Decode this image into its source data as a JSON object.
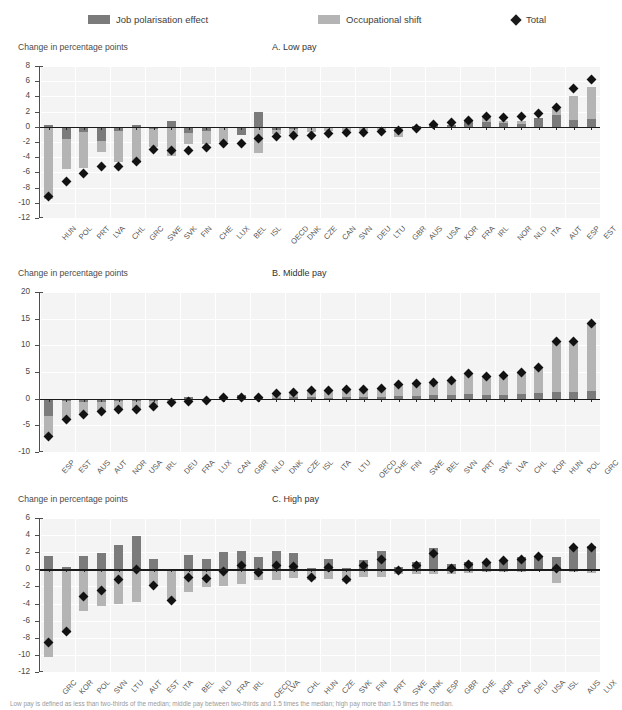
{
  "legend": {
    "items": [
      {
        "label": "Job polarisation effect",
        "marker": "square-dark",
        "color": "#7b7b7b",
        "x": 88
      },
      {
        "label": "Occupational shift",
        "marker": "square-light",
        "color": "#b4b4b4",
        "x": 318
      },
      {
        "label": "Total",
        "marker": "diamond",
        "color": "#1b1b1b",
        "x": 512
      }
    ]
  },
  "axis_title": "Change in percentage points",
  "footnote": "Low pay is defined as less than two-thirds of the median; middle pay between two-thirds and 1.5 times the median; high pay more than 1.5 times the median.",
  "chart_data": [
    {
      "type": "bar",
      "panel": "A",
      "title": "A. Low pay",
      "ylabel": "Change in percentage points",
      "xlabel": "",
      "ylim": [
        -12,
        8
      ],
      "yticks": [
        8,
        6,
        4,
        2,
        0,
        -2,
        -4,
        -6,
        -8,
        -10,
        -12
      ],
      "grid": true,
      "legend_position": "top",
      "categories": [
        "HUN",
        "POL",
        "PRT",
        "LVA",
        "CHL",
        "GRC",
        "SWE",
        "SVK",
        "FIN",
        "CHE",
        "LUX",
        "BEL",
        "ISL",
        "OECD",
        "DNK",
        "CZE",
        "CAN",
        "SVN",
        "DEU",
        "LTU",
        "GBR",
        "AUS",
        "USA",
        "KOR",
        "FRA",
        "IRL",
        "NOR",
        "NLD",
        "ITA",
        "AUT",
        "ESP",
        "EST"
      ],
      "series": [
        {
          "name": "Job polarisation effect",
          "values": [
            0.3,
            -1.6,
            -0.7,
            -1.9,
            -0.6,
            0.3,
            -0.3,
            0.8,
            -0.8,
            -0.5,
            -0.2,
            -1.1,
            1.9,
            -0.4,
            -0.3,
            -0.2,
            -0.1,
            -0.1,
            -0.1,
            -0.1,
            -0.1,
            0.1,
            0.4,
            0.3,
            0.8,
            0.6,
            0.5,
            0.4,
            1.1,
            1.6,
            0.9,
            1.0
          ]
        },
        {
          "name": "Occupational shift",
          "values": [
            -9.5,
            -5.6,
            -5.4,
            -3.3,
            -4.6,
            -4.8,
            -2.7,
            -3.9,
            -2.3,
            -2.2,
            -2.0,
            -1.1,
            -3.4,
            -0.9,
            -0.9,
            -0.7,
            -0.6,
            -0.6,
            -0.6,
            -0.4,
            -1.3,
            -0.2,
            -0.2,
            0.1,
            0.3,
            1.3,
            0.7,
            0.8,
            0.8,
            2.3,
            4.0,
            5.2
          ]
        }
      ],
      "total": {
        "name": "Total",
        "values": [
          -9.2,
          -7.2,
          -6.1,
          -5.2,
          -5.2,
          -4.5,
          -3.0,
          -3.1,
          -3.1,
          -2.7,
          -2.2,
          -2.2,
          -1.5,
          -1.3,
          -1.2,
          -1.1,
          -0.9,
          -0.7,
          -0.7,
          -0.6,
          -0.5,
          -0.2,
          0.3,
          0.6,
          0.8,
          1.4,
          1.2,
          1.3,
          1.8,
          2.6,
          5.0,
          6.2
        ]
      }
    },
    {
      "type": "bar",
      "panel": "B",
      "title": "B. Middle pay",
      "ylabel": "Change in percentage points",
      "xlabel": "",
      "ylim": [
        -10,
        20
      ],
      "yticks": [
        20,
        15,
        10,
        5,
        0,
        -5,
        -10
      ],
      "grid": true,
      "legend_position": "top",
      "categories": [
        "ESP",
        "EST",
        "AUS",
        "AUT",
        "NOR",
        "USA",
        "IRL",
        "DEU",
        "FRA",
        "LUX",
        "CAN",
        "GBR",
        "NLD",
        "DNK",
        "CZE",
        "ISL",
        "ITA",
        "LTU",
        "OECD",
        "CHE",
        "FIN",
        "SWE",
        "BEL",
        "SVN",
        "PRT",
        "SVK",
        "LVA",
        "CHL",
        "KOR",
        "HUN",
        "POL",
        "GRC"
      ],
      "series": [
        {
          "name": "Job polarisation effect",
          "values": [
            -3.2,
            -0.5,
            -0.6,
            -0.7,
            -0.5,
            -0.4,
            -0.4,
            -0.3,
            0.4,
            -0.2,
            0.2,
            0.6,
            0.1,
            0.2,
            0.3,
            0.3,
            0.2,
            0.3,
            0.3,
            0.4,
            0.5,
            0.5,
            0.6,
            0.6,
            0.8,
            0.6,
            0.6,
            0.8,
            1.1,
            1.2,
            1.3,
            1.4
          ]
        },
        {
          "name": "Occupational shift",
          "values": [
            -7.2,
            -3.9,
            -3.0,
            -2.4,
            -2.1,
            -2.0,
            -1.4,
            -0.7,
            -0.6,
            -0.4,
            0.2,
            0.2,
            0.2,
            1.0,
            1.2,
            1.5,
            1.5,
            1.8,
            1.8,
            2.0,
            2.6,
            2.9,
            3.0,
            3.5,
            4.8,
            4.2,
            4.4,
            4.9,
            5.8,
            10.7,
            10.8,
            14.1
          ]
        }
      ],
      "total": {
        "name": "Total",
        "values": [
          -7.1,
          -3.9,
          -2.9,
          -2.4,
          -2.1,
          -2.0,
          -1.4,
          -0.7,
          -0.5,
          -0.4,
          0.2,
          0.2,
          0.2,
          1.0,
          1.2,
          1.5,
          1.5,
          1.8,
          1.8,
          2.0,
          2.6,
          2.9,
          3.0,
          3.5,
          4.8,
          4.2,
          4.4,
          4.9,
          5.8,
          10.7,
          10.8,
          14.1
        ]
      }
    },
    {
      "type": "bar",
      "panel": "C",
      "title": "C. High pay",
      "ylabel": "Change in percentage points",
      "xlabel": "",
      "ylim": [
        -12,
        6
      ],
      "yticks": [
        6,
        4,
        2,
        0,
        -2,
        -4,
        -6,
        -8,
        -10,
        -12
      ],
      "grid": true,
      "legend_position": "top",
      "categories": [
        "GRC",
        "KOR",
        "POL",
        "SVN",
        "LTU",
        "AUT",
        "EST",
        "ITA",
        "BEL",
        "NLD",
        "FRA",
        "IRL",
        "OECD",
        "LVA",
        "CHL",
        "HUN",
        "CZE",
        "SVK",
        "FIN",
        "PRT",
        "SWE",
        "DNK",
        "ESP",
        "GBR",
        "CHE",
        "NOR",
        "CAN",
        "DEU",
        "USA",
        "ISL",
        "AUS",
        "LUX"
      ],
      "series": [
        {
          "name": "Job polarisation effect",
          "values": [
            1.6,
            0.3,
            1.6,
            1.9,
            2.9,
            3.9,
            1.2,
            0.0,
            1.7,
            1.2,
            2.0,
            2.2,
            1.4,
            2.1,
            1.9,
            0.1,
            1.2,
            0.1,
            1.1,
            2.1,
            0.3,
            0.8,
            2.5,
            0.6,
            0.9,
            0.8,
            1.1,
            1.4,
            1.6,
            1.5,
            2.6,
            2.7
          ]
        },
        {
          "name": "Occupational shift",
          "values": [
            -10.3,
            -7.5,
            -4.9,
            -4.3,
            -4.1,
            -3.8,
            -2.0,
            -3.6,
            -2.7,
            -2.1,
            -2.0,
            -1.7,
            -1.3,
            -1.2,
            -1.0,
            -1.3,
            -1.1,
            -1.5,
            -0.9,
            -0.9,
            -0.5,
            -0.5,
            -0.5,
            -0.5,
            -0.4,
            -0.3,
            -0.3,
            -0.3,
            -0.2,
            -1.6,
            -0.3,
            -0.4
          ]
        }
      ],
      "total": {
        "name": "Total",
        "values": [
          -8.6,
          -7.3,
          -3.2,
          -2.5,
          -1.2,
          0.0,
          -1.9,
          -3.6,
          -0.9,
          -1.1,
          -0.2,
          0.4,
          -0.4,
          0.5,
          0.3,
          -1.0,
          0.2,
          -1.2,
          0.4,
          1.2,
          -0.1,
          0.5,
          1.9,
          0.1,
          0.6,
          0.8,
          1.0,
          1.2,
          1.5,
          0.1,
          2.5,
          2.6
        ]
      }
    }
  ]
}
